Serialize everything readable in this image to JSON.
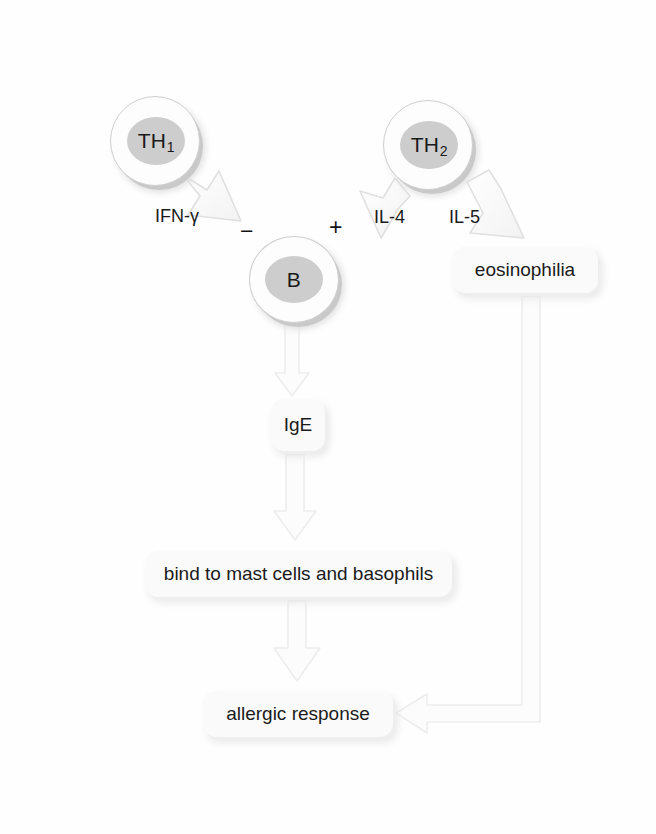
{
  "figure": {
    "type": "immunology-flowchart"
  },
  "ghost_text": {
    "top": " ",
    "bottom": " ",
    "bottom2": " "
  },
  "cells": [
    {
      "id": "th1",
      "label": "TH",
      "subscript": "1",
      "name": "T helper 1 cell"
    },
    {
      "id": "th2",
      "label": "TH",
      "subscript": "2",
      "name": "T helper 2 cell"
    },
    {
      "id": "b",
      "label": "B",
      "subscript": "",
      "name": "B cell"
    }
  ],
  "cytokines": {
    "ifn_gamma": "IFN-γ",
    "il4": "IL-4",
    "il5": "IL-5"
  },
  "signs": {
    "inhibit": "−",
    "activate": "+"
  },
  "boxes": {
    "eosinophilia": "eosinophilia",
    "ige": "IgE",
    "mast": "bind to mast cells and basophils",
    "allergic": "allergic response"
  },
  "colors": {
    "paper": "#fefefe",
    "cell_fill": "#fdfdfd",
    "cell_outline": "#cfcfcf",
    "nucleus": "#cdcdcd",
    "box_fill": "#fafafa",
    "arrow_fill": "#fbfbfb",
    "arrow_stroke": "#e3e3e3",
    "text": "#1b1b1b"
  },
  "edges": [
    {
      "from": "th1",
      "to": "b",
      "label": "IFN-γ",
      "sign": "−",
      "style": "block-arrow-diagonal"
    },
    {
      "from": "th2",
      "to": "b",
      "label": "IL-4",
      "sign": "+",
      "style": "block-arrow-diagonal"
    },
    {
      "from": "th2",
      "to": "eosinophilia",
      "label": "IL-5",
      "sign": "",
      "style": "block-arrow-diagonal"
    },
    {
      "from": "b",
      "to": "ige",
      "label": "",
      "sign": "",
      "style": "block-arrow-down"
    },
    {
      "from": "ige",
      "to": "mast",
      "label": "",
      "sign": "",
      "style": "block-arrow-down"
    },
    {
      "from": "mast",
      "to": "allergic",
      "label": "",
      "sign": "",
      "style": "block-arrow-down"
    },
    {
      "from": "eosinophilia",
      "to": "allergic",
      "label": "",
      "sign": "",
      "style": "block-arrow-elbow-left"
    }
  ]
}
